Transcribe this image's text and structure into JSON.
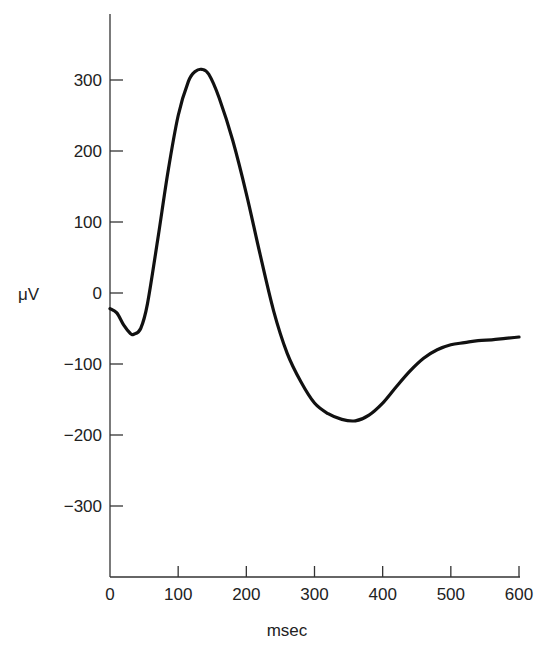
{
  "chart_data": {
    "type": "line",
    "title": "",
    "xlabel": "msec",
    "ylabel": "μV",
    "xlim": [
      0,
      600
    ],
    "ylim": [
      -400,
      400
    ],
    "x_ticks": [
      0,
      100,
      200,
      300,
      400,
      500,
      600
    ],
    "x_tick_labels": [
      "0",
      "100",
      "200",
      "300",
      "400",
      "500",
      "600"
    ],
    "y_ticks": [
      300,
      200,
      100,
      0,
      -100,
      -200,
      -300
    ],
    "y_tick_labels": [
      "300",
      "200",
      "100",
      "0",
      "−100",
      "−200",
      "−300"
    ],
    "grid": false,
    "legend": "none",
    "series": [
      {
        "name": "waveform",
        "x": [
          0,
          10,
          20,
          30,
          35,
          45,
          55,
          70,
          85,
          100,
          115,
          125,
          135,
          145,
          160,
          180,
          200,
          220,
          240,
          260,
          280,
          300,
          320,
          340,
          360,
          380,
          400,
          420,
          440,
          460,
          480,
          500,
          520,
          540,
          560,
          580,
          600
        ],
        "y": [
          -22,
          -28,
          -45,
          -57,
          -58,
          -50,
          -15,
          75,
          170,
          250,
          298,
          312,
          315,
          308,
          275,
          215,
          140,
          55,
          -25,
          -85,
          -125,
          -155,
          -170,
          -178,
          -180,
          -172,
          -155,
          -132,
          -110,
          -92,
          -80,
          -73,
          -70,
          -67,
          -66,
          -64,
          -62
        ]
      }
    ]
  }
}
